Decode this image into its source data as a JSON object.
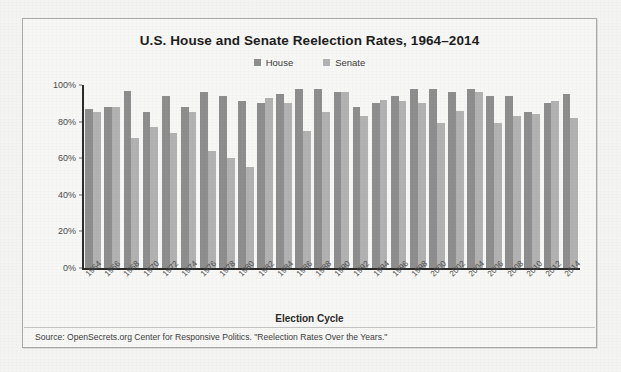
{
  "chart_data": {
    "type": "bar",
    "title": "U.S. House and Senate Reelection Rates, 1964–2014",
    "xlabel": "Election Cycle",
    "ylabel": "",
    "ylim": [
      0,
      100
    ],
    "ytick_labels": [
      "0%",
      "20%",
      "40%",
      "60%",
      "80%",
      "100%"
    ],
    "ytick_values": [
      0,
      20,
      40,
      60,
      80,
      100
    ],
    "grid": false,
    "legend_position": "top-center",
    "categories": [
      "1964",
      "1966",
      "1968",
      "1970",
      "1972",
      "1974",
      "1976",
      "1978",
      "1980",
      "1982",
      "1984",
      "1986",
      "1988",
      "1990",
      "1992",
      "1994",
      "1996",
      "1998",
      "2000",
      "2002",
      "2004",
      "2006",
      "2008",
      "2010",
      "2012",
      "2014"
    ],
    "series": [
      {
        "name": "House",
        "color": "#8e8e8e",
        "values": [
          87,
          88,
          97,
          85,
          94,
          88,
          96,
          94,
          91,
          90,
          95,
          98,
          98,
          96,
          88,
          90,
          94,
          98,
          98,
          96,
          98,
          94,
          94,
          85,
          90,
          95
        ]
      },
      {
        "name": "Senate",
        "color": "#b2b2b2",
        "values": [
          85,
          88,
          71,
          77,
          74,
          85,
          64,
          60,
          55,
          93,
          90,
          75,
          85,
          96,
          83,
          92,
          91,
          90,
          79,
          86,
          96,
          79,
          83,
          84,
          91,
          82
        ]
      }
    ],
    "source": "Source: OpenSecrets.org Center for Responsive Politics. \"Reelection Rates Over the Years.\""
  },
  "legend": {
    "house_label": "House",
    "senate_label": "Senate"
  }
}
